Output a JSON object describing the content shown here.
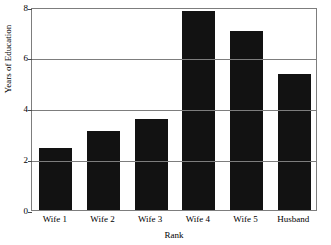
{
  "chart_data": {
    "type": "bar",
    "title": "",
    "xlabel": "Rank",
    "ylabel": "Years of Education",
    "categories": [
      "Wife 1",
      "Wife 2",
      "Wife 3",
      "Wife 4",
      "Wife 5",
      "Husband"
    ],
    "values": [
      2.45,
      3.1,
      3.6,
      7.85,
      7.05,
      5.35
    ],
    "ylim": [
      0,
      8
    ],
    "yticks": [
      0,
      2,
      4,
      6,
      8
    ],
    "ytick_labels": [
      "0",
      "2",
      "4",
      "6",
      "8"
    ],
    "grid": true,
    "legend": "none",
    "bar_color": "#121212",
    "axis_color": "#7d7d7d",
    "background_color": "#ffffff"
  }
}
